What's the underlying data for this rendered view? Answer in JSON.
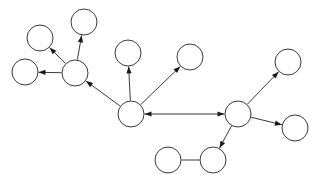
{
  "diagram": {
    "background_color": "#ffffff",
    "node_fill_color": "#ffffff",
    "node_stroke_color": "#3a3a3a",
    "edge_color": "#3a3a3a",
    "arrowhead_color": "#1a1a1a",
    "node_count": 13,
    "edge_count": 12,
    "canvas": {
      "width": 320,
      "height": 184
    }
  },
  "chart_data": {
    "type": "diagram",
    "xlabel": "",
    "ylabel": "",
    "nodes": [
      {
        "id": "n1",
        "label": "",
        "cx": 40,
        "cy": 38,
        "r": 13
      },
      {
        "id": "n2",
        "label": "",
        "cx": 84,
        "cy": 22,
        "r": 13
      },
      {
        "id": "n3",
        "label": "",
        "cx": 25,
        "cy": 72,
        "r": 13
      },
      {
        "id": "n4",
        "label": "",
        "cx": 75,
        "cy": 73,
        "r": 13
      },
      {
        "id": "n5",
        "label": "",
        "cx": 128,
        "cy": 53,
        "r": 13
      },
      {
        "id": "n6",
        "label": "",
        "cx": 190,
        "cy": 57,
        "r": 13
      },
      {
        "id": "n7",
        "label": "",
        "cx": 131,
        "cy": 114,
        "r": 13
      },
      {
        "id": "n8",
        "label": "",
        "cx": 238,
        "cy": 114,
        "r": 13
      },
      {
        "id": "n9",
        "label": "",
        "cx": 288,
        "cy": 62,
        "r": 13
      },
      {
        "id": "n10",
        "label": "",
        "cx": 295,
        "cy": 128,
        "r": 13
      },
      {
        "id": "n11",
        "label": "",
        "cx": 168,
        "cy": 160,
        "r": 13
      },
      {
        "id": "n12",
        "label": "",
        "cx": 213,
        "cy": 160,
        "r": 13
      },
      {
        "id": "n13",
        "label": "",
        "cx": 84,
        "cy": 22,
        "r": 13
      }
    ],
    "edges": [
      {
        "id": "e1",
        "from": "n4",
        "to": "n1",
        "directed": true,
        "bidirectional": false
      },
      {
        "id": "e2",
        "from": "n4",
        "to": "n2",
        "directed": true,
        "bidirectional": false
      },
      {
        "id": "e3",
        "from": "n4",
        "to": "n3",
        "directed": true,
        "bidirectional": false
      },
      {
        "id": "e4",
        "from": "n7",
        "to": "n4",
        "directed": true,
        "bidirectional": false
      },
      {
        "id": "e5",
        "from": "n7",
        "to": "n5",
        "directed": true,
        "bidirectional": false
      },
      {
        "id": "e6",
        "from": "n7",
        "to": "n6",
        "directed": true,
        "bidirectional": false
      },
      {
        "id": "e7",
        "from": "n7",
        "to": "n8",
        "directed": true,
        "bidirectional": true
      },
      {
        "id": "e8",
        "from": "n8",
        "to": "n9",
        "directed": true,
        "bidirectional": false
      },
      {
        "id": "e9",
        "from": "n8",
        "to": "n10",
        "directed": true,
        "bidirectional": false
      },
      {
        "id": "e10",
        "from": "n8",
        "to": "n12",
        "directed": true,
        "bidirectional": false
      },
      {
        "id": "e11",
        "from": "n11",
        "to": "n12",
        "directed": false,
        "bidirectional": false
      }
    ],
    "legend": [],
    "annotations": []
  }
}
